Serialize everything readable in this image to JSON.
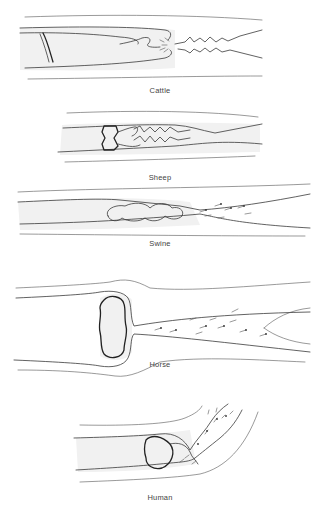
{
  "figure": {
    "panels": [
      {
        "id": "cattle",
        "label": "Cattle"
      },
      {
        "id": "sheep",
        "label": "Sheep"
      },
      {
        "id": "swine",
        "label": "Swine"
      },
      {
        "id": "horse",
        "label": "Horse"
      },
      {
        "id": "human",
        "label": "Human"
      }
    ],
    "colors": {
      "line": "#3a3a3a",
      "label": "#444444",
      "background": "#ffffff"
    }
  }
}
